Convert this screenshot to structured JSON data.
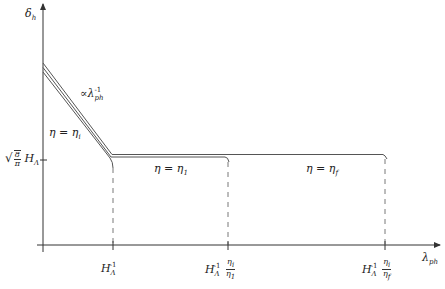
{
  "diagram": {
    "y_axis": {
      "label": "δ",
      "label_sub": "h"
    },
    "x_axis": {
      "label": "λ",
      "label_sub": "ph"
    },
    "y_tick": {
      "sqrt_num": "8",
      "sqrt_den": "π",
      "label": "H",
      "label_sub": "Λ"
    },
    "x_ticks": [
      {
        "H": "H",
        "sub": "Λ",
        "sup": "-1",
        "frac_num": "",
        "frac_den": ""
      },
      {
        "H": "H",
        "sub": "Λ",
        "sup": "-1",
        "frac_num": "η",
        "frac_num_sub": "i",
        "frac_den": "η",
        "frac_den_sub": "1"
      },
      {
        "H": "H",
        "sub": "Λ",
        "sup": "-1",
        "frac_num": "η",
        "frac_num_sub": "i",
        "frac_den": "η",
        "frac_den_sub": "f"
      }
    ],
    "annotations": {
      "slope": {
        "prefix": "∝λ",
        "sub": "ph",
        "sup": "-1"
      },
      "eta_i": {
        "text": "η = η",
        "sub": "i"
      },
      "eta_1": {
        "text": "η = η",
        "sub": "1"
      },
      "eta_f": {
        "text": "η = η",
        "sub": "f"
      }
    },
    "curves": [
      {
        "name": "eta_i",
        "end_x_label": "H_Λ^-1"
      },
      {
        "name": "eta_1",
        "end_x_label": "H_Λ^-1 η_i/η_1"
      },
      {
        "name": "eta_f",
        "end_x_label": "H_Λ^-1 η_i/η_f"
      }
    ],
    "colors": {
      "axis": "#333333",
      "line": "#555555",
      "dash": "#555555"
    }
  }
}
